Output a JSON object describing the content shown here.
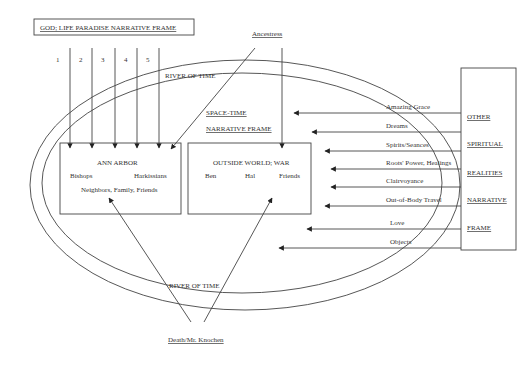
{
  "title": "GOD; LIFE PARADISE NARRATIVE FRAME",
  "numbered_lines": [
    "1",
    "2",
    "3",
    "4",
    "5"
  ],
  "ancestress": "Ancestress",
  "river_top": "RIVER OF TIME",
  "river_bottom": "RIVER OF TIME",
  "space_time": [
    "SPACE-TIME",
    "NARRATIVE FRAME"
  ],
  "ann_arbor": {
    "title": "ANN ARBOR",
    "left": "Bishops",
    "right": "Harkissians",
    "bottom": "Neighbors, Family, Friends"
  },
  "outside_world": {
    "title": "OUTSIDE WORLD; WAR",
    "items": [
      "Ben",
      "Hal",
      "Friends"
    ]
  },
  "other_frame": {
    "labels": [
      "OTHER",
      "SPIRITUAL",
      "REALITIES",
      "NARRATIVE",
      "FRAME"
    ],
    "arrows": [
      "Amazing Grace",
      "Dreams",
      "Spirits/Seances",
      "Roots' Power, Healings",
      "Clairvoyance",
      "Out-of-Body Travel",
      "Love",
      "Objects"
    ]
  },
  "death": "Death/Mr. Knochen"
}
